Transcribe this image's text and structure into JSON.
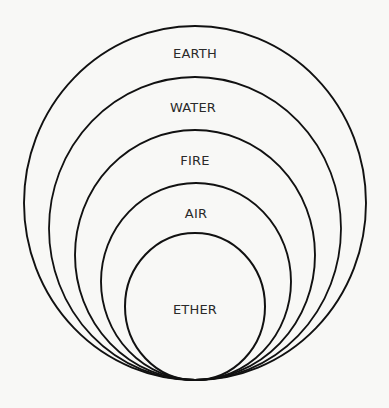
{
  "diagram": {
    "title": "",
    "tangent_point": {
      "x": 195,
      "y": 380
    },
    "layers": [
      {
        "name": "EARTH",
        "cx": 195,
        "rx": 171,
        "ry": 177,
        "stroke": 1.9,
        "label_x": 195,
        "label_y": 53
      },
      {
        "name": "WATER",
        "cx": 195,
        "rx": 146,
        "ry": 151.5,
        "stroke": 1.8,
        "label_x": 193,
        "label_y": 107
      },
      {
        "name": "FIRE",
        "cx": 195,
        "rx": 120,
        "ry": 125,
        "stroke": 1.9,
        "label_x": 195,
        "label_y": 160
      },
      {
        "name": "AIR",
        "cx": 196,
        "rx": 95,
        "ry": 98.5,
        "stroke": 1.9,
        "label_x": 196,
        "label_y": 213
      },
      {
        "name": "ETHER",
        "cx": 195,
        "rx": 70,
        "ry": 73.5,
        "stroke": 2.0,
        "label_x": 195,
        "label_y": 309
      }
    ]
  }
}
